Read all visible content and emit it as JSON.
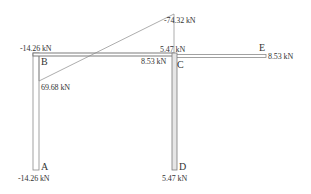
{
  "diagram": {
    "type": "frame-axial-force-diagram",
    "nodes": {
      "A": "A",
      "B": "B",
      "C": "C",
      "D": "D",
      "E": "E"
    },
    "labels": {
      "B_top": "-14.26 kN",
      "B_diag": "69.68 kN",
      "peak": "-74.32 kN",
      "C_top": "5.47 kN",
      "C_left": "8.53 kN",
      "E_right": "8.53 kN",
      "A_bottom": "-14.26 kN",
      "D_bottom": "5.47 kN"
    },
    "colors": {
      "member_stroke": "#7a7a7a",
      "member_fill": "#ffffff",
      "diagram_line": "#8a8a8a",
      "text": "#333333"
    }
  }
}
